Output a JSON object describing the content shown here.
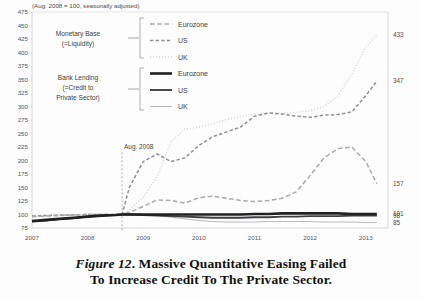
{
  "figure": {
    "subtitle": "(Aug. 2008 = 100, seasonally adjusted)",
    "caption_line1_prefix": "Figure 12",
    "caption_line1": ". Massive Quantitative Easing Failed",
    "caption_line2": "To Increase Credit To The Private Sector."
  },
  "annotations": {
    "event_label": "Aug. 2008",
    "group_monetary_line1": "Monetary Base",
    "group_monetary_line2": "(=Liquidity)",
    "group_lending_line1": "Bank Lending",
    "group_lending_line2": "(=Credit to",
    "group_lending_line3": "Private Sector)"
  },
  "legend": {
    "position": "top-center",
    "items": [
      {
        "label": "Eurozone",
        "group": "Monetary Base",
        "style": "dashed-long",
        "color": "#a9a9ab",
        "width": 1.5
      },
      {
        "label": "US",
        "group": "Monetary Base",
        "style": "dashed-medium",
        "color": "#8f9093",
        "width": 1.5
      },
      {
        "label": "UK",
        "group": "Monetary Base",
        "style": "dotted",
        "color": "#cfcfd1",
        "width": 1.5
      },
      {
        "label": "Eurozone",
        "group": "Bank Lending",
        "style": "solid-thick",
        "color": "#202024",
        "width": 2.6
      },
      {
        "label": "US",
        "group": "Bank Lending",
        "style": "solid-medium",
        "color": "#404044",
        "width": 1.9
      },
      {
        "label": "UK",
        "group": "Bank Lending",
        "style": "solid-thin",
        "color": "#b9babc",
        "width": 1.0
      }
    ]
  },
  "chart_data": {
    "type": "line",
    "title": "",
    "subtitle": "(Aug. 2008 = 100, seasonally adjusted)",
    "xlabel": "",
    "ylabel": "",
    "xlim": [
      2007,
      2013.4
    ],
    "ylim": [
      75,
      475
    ],
    "ytick_step": 25,
    "grid": false,
    "yticks": [
      75,
      100,
      125,
      150,
      175,
      200,
      225,
      250,
      275,
      300,
      325,
      350,
      375,
      400,
      425,
      450,
      475
    ],
    "xticks": [
      2007,
      2008,
      2009,
      2010,
      2011,
      2012,
      2013
    ],
    "xtick_labels": [
      "2007",
      "2008",
      "2009",
      "2010",
      "2011",
      "2012",
      "2013"
    ],
    "event_marker_x": 2008.62,
    "end_labels": [
      {
        "value": 433,
        "series": "Monetary Base UK"
      },
      {
        "value": 347,
        "series": "Monetary Base US"
      },
      {
        "value": 157,
        "series": "Monetary Base Eurozone"
      },
      {
        "value": 101,
        "series": "Bank Lending Eurozone"
      },
      {
        "value": 98,
        "series": "Bank Lending US"
      },
      {
        "value": 85,
        "series": "Bank Lending UK"
      }
    ],
    "x": [
      2007.0,
      2007.25,
      2007.5,
      2007.75,
      2008.0,
      2008.25,
      2008.5,
      2008.62,
      2008.75,
      2009.0,
      2009.25,
      2009.5,
      2009.75,
      2010.0,
      2010.25,
      2010.5,
      2010.75,
      2011.0,
      2011.25,
      2011.5,
      2011.75,
      2012.0,
      2012.25,
      2012.5,
      2012.75,
      2013.0,
      2013.2
    ],
    "series": [
      {
        "name": "Monetary Base UK",
        "style": "dotted",
        "color": "#cfcfd1",
        "end_value": 433,
        "values": [
          98,
          98,
          99,
          99,
          100,
          100,
          100,
          100,
          108,
          132,
          170,
          235,
          258,
          262,
          268,
          276,
          281,
          286,
          288,
          288,
          289,
          292,
          300,
          320,
          360,
          410,
          433
        ]
      },
      {
        "name": "Monetary Base US",
        "style": "dashed-medium",
        "color": "#8f9093",
        "end_value": 347,
        "values": [
          97,
          98,
          99,
          99,
          100,
          100,
          100,
          100,
          150,
          198,
          212,
          198,
          205,
          228,
          244,
          253,
          262,
          282,
          288,
          286,
          282,
          280,
          284,
          285,
          290,
          320,
          347
        ]
      },
      {
        "name": "Monetary Base Eurozone",
        "style": "dashed-long",
        "color": "#a9a9ab",
        "end_value": 157,
        "values": [
          96,
          97,
          98,
          99,
          100,
          100,
          100,
          100,
          104,
          115,
          127,
          126,
          121,
          131,
          134,
          130,
          126,
          124,
          126,
          130,
          142,
          172,
          205,
          222,
          225,
          198,
          157
        ]
      },
      {
        "name": "Bank Lending Eurozone",
        "style": "solid-thick",
        "color": "#202024",
        "end_value": 101,
        "values": [
          88,
          90,
          92,
          94,
          96,
          98,
          99,
          100,
          100,
          100,
          100,
          100,
          100,
          100,
          100,
          100,
          100,
          101,
          101,
          102,
          102,
          102,
          102,
          102,
          101,
          101,
          101
        ]
      },
      {
        "name": "Bank Lending US",
        "style": "solid-medium",
        "color": "#404044",
        "end_value": 98,
        "values": [
          87,
          89,
          91,
          93,
          96,
          98,
          99,
          100,
          100,
          99,
          98,
          97,
          96,
          95,
          94,
          94,
          94,
          95,
          95,
          96,
          96,
          97,
          97,
          97,
          98,
          98,
          98
        ]
      },
      {
        "name": "Bank Lending UK",
        "style": "solid-thin",
        "color": "#b9babc",
        "end_value": 85,
        "values": [
          86,
          88,
          91,
          93,
          96,
          98,
          99,
          100,
          101,
          100,
          98,
          95,
          92,
          89,
          87,
          86,
          86,
          86,
          87,
          87,
          87,
          87,
          86,
          86,
          86,
          85,
          85
        ]
      }
    ]
  }
}
